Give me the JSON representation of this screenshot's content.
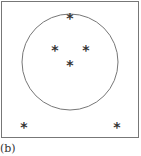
{
  "figure": {
    "label": "(b)",
    "box": {
      "x": 1.5,
      "y": 1.5,
      "w": 137,
      "h": 136,
      "stroke": "#777777"
    },
    "circle": {
      "cx": 70,
      "cy": 62,
      "r": 48,
      "stroke": "#777777"
    },
    "points": [
      {
        "x": 70,
        "y": 16,
        "glyph": "*"
      },
      {
        "x": 55,
        "y": 48,
        "glyph": "*"
      },
      {
        "x": 86,
        "y": 48,
        "glyph": "*"
      },
      {
        "x": 70,
        "y": 63,
        "glyph": "*"
      },
      {
        "x": 24,
        "y": 125,
        "glyph": "*"
      },
      {
        "x": 117,
        "y": 125,
        "glyph": "*"
      }
    ]
  }
}
